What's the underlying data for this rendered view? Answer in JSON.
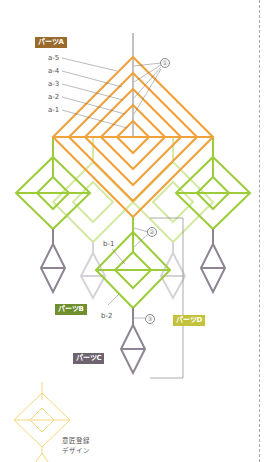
{
  "colors": {
    "partA": "#f0a23c",
    "partA_label": "#9a6a2c",
    "partB": "#9ccc3a",
    "partB_faint": "#d4e9a4",
    "partB_label": "#6f8f2e",
    "partC": "#8f8494",
    "partC_faint": "#cfcbd2",
    "partC_label": "#6e6470",
    "partD_label": "#c4c23a",
    "design": "#f5d780",
    "leader": "#777777"
  },
  "labels": {
    "partA": "パーツA",
    "partB": "パーツB",
    "partC": "パーツC",
    "partD": "パーツD"
  },
  "strands_a": [
    "a-5",
    "a-4",
    "a-3",
    "a-2",
    "a-1"
  ],
  "strands_b": [
    "b-1",
    "b-2"
  ],
  "markers": {
    "m1": "①",
    "m2": "②",
    "m3": "③"
  },
  "caption": {
    "line1": "意匠登録",
    "line2": "デザイン"
  }
}
